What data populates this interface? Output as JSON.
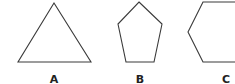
{
  "figures": [
    {
      "label": "A",
      "shape": "triangle",
      "points": "54,3 91,62 18,62",
      "label_x": 54,
      "label_y": 83
    },
    {
      "label": "B",
      "shape": "pentagon",
      "points": "139,2 162,24 154,62 126,62 118,24",
      "label_x": 140,
      "label_y": 83
    },
    {
      "label": "C",
      "shape": "hexagon",
      "points": "240,2 203,2 188,32 203,62 240,62",
      "label_x": 226,
      "label_y": 83
    }
  ],
  "colors": {
    "stroke": "#3a3a3a",
    "label": "#222222"
  }
}
